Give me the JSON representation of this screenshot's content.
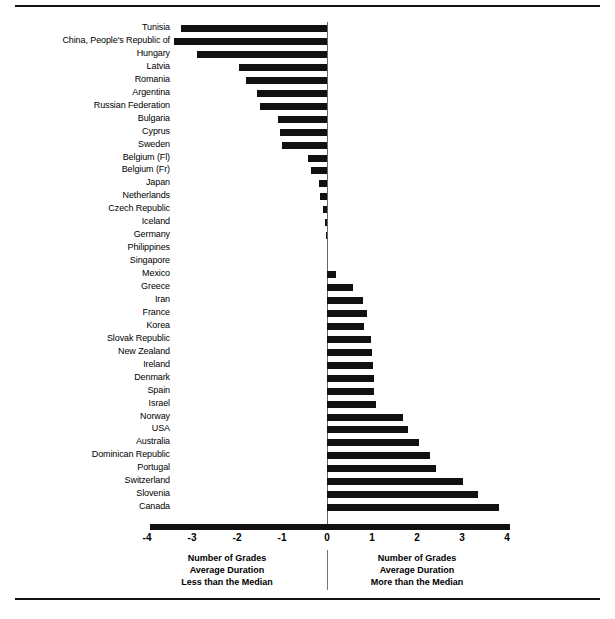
{
  "chart_data": {
    "type": "bar",
    "orientation": "horizontal",
    "title": "",
    "xlabel": "Number of Grades",
    "ylabel": "",
    "xlim": [
      -4,
      4
    ],
    "xticks": [
      -4,
      -3,
      -2,
      -1,
      0,
      1,
      2,
      3,
      4
    ],
    "xtick_labels": [
      "-4",
      "-3",
      "-2",
      "-1",
      "0",
      "1",
      "2",
      "3",
      "4"
    ],
    "grid": false,
    "legend": "none",
    "bar_color": "#111111",
    "zero_reference": 0,
    "categories": [
      "Tunisia",
      "China, People's Republic of",
      "Hungary",
      "Latvia",
      "Romania",
      "Argentina",
      "Russian Federation",
      "Bulgaria",
      "Cyprus",
      "Sweden",
      "Belgium (Fl)",
      "Belgium (Fr)",
      "Japan",
      "Netherlands",
      "Czech Republic",
      "Iceland",
      "Germany",
      "Philippines",
      "Singapore",
      "Mexico",
      "Greece",
      "Iran",
      "France",
      "Korea",
      "Slovak Republic",
      "New Zealand",
      "Ireland",
      "Denmark",
      "Spain",
      "Israel",
      "Norway",
      "USA",
      "Australia",
      "Dominican Republic",
      "Portugal",
      "Switzerland",
      "Slovenia",
      "Canada"
    ],
    "values": [
      -3.25,
      -3.4,
      -2.9,
      -1.95,
      -1.8,
      -1.55,
      -1.5,
      -1.1,
      -1.05,
      -1.0,
      -0.42,
      -0.36,
      -0.18,
      -0.15,
      -0.09,
      -0.05,
      -0.03,
      0.0,
      0.0,
      0.19,
      0.57,
      0.79,
      0.88,
      0.83,
      0.97,
      0.99,
      1.02,
      1.04,
      1.05,
      1.08,
      1.69,
      1.8,
      2.04,
      2.29,
      2.42,
      3.02,
      3.35,
      3.82
    ]
  },
  "captions": {
    "left": [
      "Number of Grades",
      "Average Duration",
      "Less than the Median"
    ],
    "right": [
      "Number of Grades",
      "Average Duration",
      "More than the Median"
    ]
  }
}
